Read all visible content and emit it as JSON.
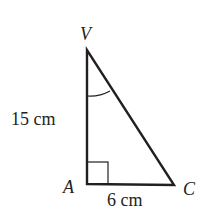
{
  "figure": {
    "type": "right-triangle",
    "vertices": {
      "V": {
        "label": "V",
        "x": 87,
        "y": 50
      },
      "A": {
        "label": "A",
        "x": 87,
        "y": 184
      },
      "C": {
        "label": "C",
        "x": 174,
        "y": 185
      }
    },
    "sides": {
      "VA": {
        "label": "15 cm"
      },
      "AC": {
        "label": "6 cm"
      }
    },
    "right_angle_at": "A",
    "marked_angle_at": "V",
    "stroke_color": "#231f20"
  }
}
